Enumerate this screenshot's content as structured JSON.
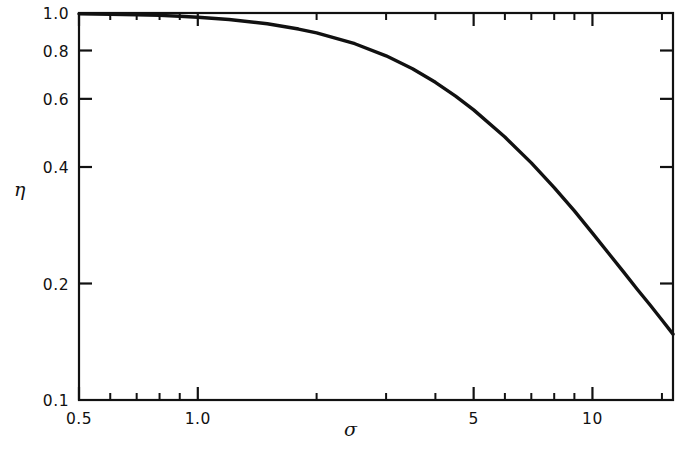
{
  "figure": {
    "background": "#ffffff",
    "line_color": "#111111",
    "axis_color": "#111111"
  },
  "chart_data": {
    "type": "line",
    "title": "",
    "subtitle": "",
    "xlabel": "σ",
    "ylabel": "η",
    "xscale": "log",
    "yscale": "log",
    "xlim": [
      0.5,
      16.0
    ],
    "ylim": [
      0.1,
      1.0
    ],
    "grid": false,
    "legend": null,
    "legend_position": "none",
    "x_major_ticks": [
      0.5,
      1.0,
      5,
      10
    ],
    "x_major_tick_labels": [
      "0.5",
      "1.0",
      "5",
      "10"
    ],
    "x_minor_ticks": [
      0.6,
      0.7,
      0.8,
      0.9,
      2,
      3,
      4,
      6,
      7,
      8,
      9,
      15
    ],
    "y_major_ticks": [
      1.0,
      0.8,
      0.6,
      0.4,
      0.2,
      0.1
    ],
    "y_major_tick_labels": [
      "1.0",
      "0.8",
      "0.6",
      "0.4",
      "0.2",
      "0.1"
    ],
    "y_minor_ticks": [],
    "series": [
      {
        "name": "efficiency",
        "x": [
          0.5,
          0.6,
          0.7,
          0.8,
          0.9,
          1.0,
          1.2,
          1.5,
          1.8,
          2.0,
          2.5,
          3.0,
          3.5,
          4.0,
          4.5,
          5.0,
          6.0,
          7.0,
          8.0,
          9.0,
          10.0,
          11.0,
          12.0,
          13.0,
          14.0,
          15.0,
          16.0
        ],
        "y": [
          0.995,
          0.993,
          0.99,
          0.986,
          0.981,
          0.975,
          0.962,
          0.938,
          0.909,
          0.888,
          0.833,
          0.775,
          0.718,
          0.662,
          0.61,
          0.562,
          0.478,
          0.41,
          0.354,
          0.308,
          0.27,
          0.239,
          0.214,
          0.193,
          0.176,
          0.161,
          0.148
        ]
      }
    ],
    "annotations": []
  }
}
